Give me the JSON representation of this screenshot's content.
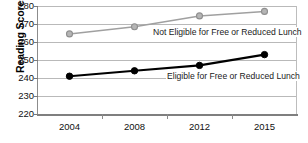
{
  "chart_data": {
    "type": "line",
    "title": "",
    "xlabel": "",
    "ylabel": "Reading Scores",
    "categories": [
      "2004",
      "2008",
      "2012",
      "2015"
    ],
    "ylim": [
      220,
      280
    ],
    "yticks": [
      280,
      270,
      260,
      250,
      240,
      230,
      220
    ],
    "grid": true,
    "legend_position": "inline-annotation",
    "series": [
      {
        "name": "Not Eligible for Free or Reduced Lunch",
        "values": [
          264.5,
          268.5,
          274.5,
          277
        ],
        "color": "#a0a0a0",
        "marker": "circle-open"
      },
      {
        "name": "Eligible for Free or Reduced Lunch",
        "values": [
          241,
          244,
          247,
          253
        ],
        "color": "#000000",
        "marker": "circle-filled"
      }
    ]
  },
  "axis": {
    "y_title": "Reading Scores"
  }
}
